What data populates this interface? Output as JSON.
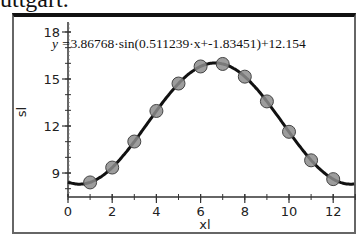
{
  "header": {
    "partial_text": "uttgart."
  },
  "equation": {
    "lhs": "y =",
    "rhs": "3.86768·sin(0.511239·x+-1.83451)+12.154"
  },
  "colors": {
    "curve": "#111111",
    "point_fill": "#8c8c8c",
    "point_stroke": "#444444",
    "frame_top": "#111111",
    "frame": "#666666"
  },
  "chart_data": {
    "type": "scatter",
    "title": "",
    "xlabel": "xl",
    "ylabel": "sl",
    "xlim": [
      0,
      13
    ],
    "ylim": [
      7.5,
      18.6
    ],
    "x_ticks": [
      0,
      2,
      4,
      6,
      8,
      10,
      12
    ],
    "y_ticks": [
      9,
      12,
      15,
      18
    ],
    "grid": false,
    "series": [
      {
        "name": "data points",
        "type": "scatter",
        "x": [
          1,
          2,
          3,
          4,
          5,
          6,
          7,
          8,
          9,
          10,
          11,
          12
        ],
        "y": [
          8.4,
          9.35,
          11.01,
          12.96,
          14.71,
          15.8,
          15.96,
          15.15,
          13.57,
          11.63,
          9.81,
          8.61
        ]
      },
      {
        "name": "fit",
        "type": "line",
        "equation": "y = 3.86768·sin(0.511239·x + -1.83451) + 12.154",
        "params": {
          "a": 3.86768,
          "b": 0.511239,
          "c": -1.83451,
          "d": 12.154
        }
      }
    ]
  }
}
